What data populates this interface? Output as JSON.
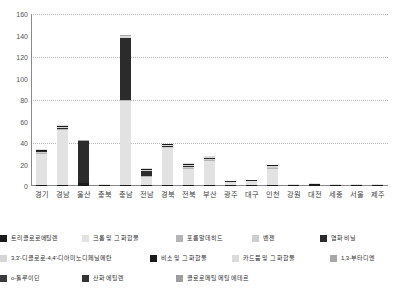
{
  "chart_data": {
    "type": "bar",
    "stacked": true,
    "title": "",
    "xlabel": "",
    "ylabel": "",
    "ylim": [
      0,
      160
    ],
    "yticks": [
      0,
      20,
      40,
      60,
      80,
      100,
      120,
      140,
      160
    ],
    "gridlines": [
      40,
      80,
      120,
      160
    ],
    "grid": true,
    "legend_position": "bottom",
    "categories": [
      "경기",
      "경남",
      "울산",
      "충북",
      "충남",
      "전남",
      "경북",
      "전북",
      "부산",
      "광주",
      "대구",
      "인천",
      "강원",
      "대전",
      "세종",
      "서울",
      "제주"
    ],
    "series": [
      {
        "name": "트리클로로에틸렌",
        "color": "#1a1a1a",
        "values": [
          1.0,
          1.0,
          2.5,
          0.3,
          1.0,
          0.5,
          1.0,
          1.0,
          1.0,
          0.3,
          0.3,
          0.5,
          0.2,
          1.8,
          0.2,
          0.2,
          0.2
        ]
      },
      {
        "name": "크롬 및 그 화합물",
        "color": "#e2e2e2",
        "values": [
          29.0,
          51.0,
          0.0,
          1.0,
          78.0,
          7.5,
          34.0,
          15.0,
          22.5,
          3.0,
          4.0,
          15.0,
          0.8,
          0.4,
          0.8,
          0.3,
          0.3
        ]
      },
      {
        "name": "포름알데히드",
        "color": "#b5b5b5",
        "values": [
          0.5,
          0.5,
          0.0,
          0.0,
          0.5,
          0.5,
          0.5,
          0.5,
          0.5,
          0.0,
          0.0,
          0.5,
          0.0,
          0.0,
          0.0,
          0.0,
          0.0
        ]
      },
      {
        "name": "벤젠",
        "color": "#cfcfcf",
        "values": [
          0.3,
          0.3,
          0.0,
          0.0,
          0.3,
          0.3,
          0.3,
          0.3,
          0.3,
          0.0,
          0.0,
          0.3,
          0.0,
          0.0,
          0.0,
          0.0,
          0.0
        ]
      },
      {
        "name": "염화 비닐",
        "color": "#2b2b2b",
        "values": [
          0.5,
          0.5,
          39.0,
          0.0,
          57.0,
          4.5,
          0.5,
          1.5,
          1.0,
          0.2,
          0.2,
          0.3,
          0.0,
          0.0,
          0.0,
          0.0,
          0.0
        ]
      },
      {
        "name": "3,3'-디클로로-4,4'-디아미노디페닐메탄",
        "color": "#d6d6d6",
        "values": [
          0.2,
          0.2,
          0.0,
          0.0,
          0.2,
          0.2,
          0.2,
          0.2,
          0.2,
          0.0,
          0.0,
          0.2,
          0.0,
          0.0,
          0.0,
          0.0,
          0.0
        ]
      },
      {
        "name": "비소 및 그 화합물",
        "color": "#1a1a1a",
        "values": [
          0.3,
          0.3,
          0.3,
          0.0,
          0.3,
          0.3,
          0.3,
          0.3,
          0.3,
          0.0,
          0.0,
          0.2,
          0.0,
          0.0,
          0.0,
          0.0,
          0.0
        ]
      },
      {
        "name": "카드뮴 및 그 화합물",
        "color": "#dcdcdc",
        "values": [
          0.2,
          0.2,
          0.0,
          0.0,
          0.2,
          0.2,
          0.2,
          0.2,
          0.2,
          0.0,
          0.0,
          0.0,
          0.0,
          0.0,
          0.0,
          0.0,
          0.0
        ]
      },
      {
        "name": "1,3-부타디엔",
        "color": "#a8a8a8",
        "values": [
          0.0,
          0.0,
          0.2,
          0.0,
          0.2,
          0.0,
          0.0,
          0.0,
          0.0,
          0.0,
          0.0,
          0.0,
          0.0,
          0.0,
          0.0,
          0.0,
          0.0
        ]
      },
      {
        "name": "o-톨루이딘",
        "color": "#3a3a3a",
        "values": [
          0.0,
          0.0,
          0.0,
          0.0,
          0.0,
          0.0,
          0.0,
          0.0,
          0.0,
          0.0,
          0.0,
          0.0,
          0.0,
          0.0,
          0.0,
          0.0,
          0.0
        ]
      },
      {
        "name": "산화 에틸렌",
        "color": "#333333",
        "values": [
          0.0,
          0.0,
          0.0,
          0.0,
          0.0,
          0.0,
          0.0,
          0.0,
          0.0,
          0.0,
          0.0,
          0.0,
          0.0,
          0.0,
          0.0,
          0.0,
          0.0
        ]
      },
      {
        "name": "클로로메틸 메틸 에테르",
        "color": "#9e9e9e",
        "values": [
          0.0,
          0.0,
          0.0,
          0.0,
          0.0,
          0.0,
          0.0,
          0.0,
          0.0,
          0.0,
          0.0,
          0.0,
          0.0,
          0.0,
          0.0,
          0.0,
          0.0
        ]
      }
    ],
    "totals": [
      31,
      53,
      42,
      1.3,
      137,
      13,
      36,
      18,
      25.8,
      3.5,
      4.5,
      16,
      1,
      2.2,
      1,
      0.5,
      0.5
    ]
  },
  "legend": {
    "rows": [
      [
        {
          "label": "트리클로로에틸렌",
          "color": "#1a1a1a",
          "left": 0
        },
        {
          "label": "크롬 및 그 화합물",
          "color": "#e2e2e2",
          "left": 82
        },
        {
          "label": "포름알데히드",
          "color": "#b5b5b5",
          "left": 176
        },
        {
          "label": "벤젠",
          "color": "#cfcfcf",
          "left": 252
        },
        {
          "label": "염화 비닐",
          "color": "#2b2b2b",
          "left": 320
        }
      ],
      [
        {
          "label": "3,3'-디클로로-4,4'-디아미노디페닐메탄",
          "color": "#d6d6d6",
          "left": 0
        },
        {
          "label": "비소 및 그 화합물",
          "color": "#1a1a1a",
          "left": 150
        },
        {
          "label": "카드뮴 및 그 화합물",
          "color": "#dcdcdc",
          "left": 232
        },
        {
          "label": "1,3-부타디엔",
          "color": "#a8a8a8",
          "left": 330
        }
      ],
      [
        {
          "label": "o-톨루이딘",
          "color": "#3a3a3a",
          "left": 0
        },
        {
          "label": "산화 에틸렌",
          "color": "#333333",
          "left": 82
        },
        {
          "label": "클로로메틸 메틸 에테르",
          "color": "#9e9e9e",
          "left": 176
        }
      ]
    ]
  },
  "axis": {
    "y_ticks": [
      "0",
      "20",
      "40",
      "60",
      "80",
      "100",
      "120",
      "140",
      "160"
    ]
  }
}
